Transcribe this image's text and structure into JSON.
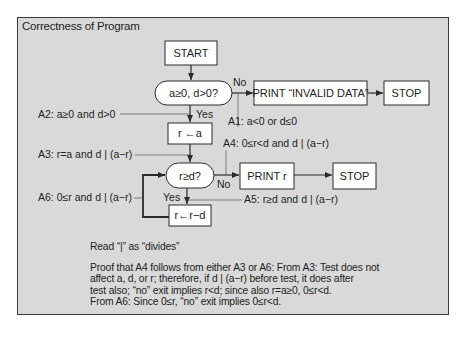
{
  "title": "Correctness of Program",
  "nodes": {
    "start": "START",
    "test1": "a≥0, d>0?",
    "print_invalid": "PRINT “INVALID DATA”",
    "stop1": "STOP",
    "assign_r": "r ←a",
    "test2": "r≥d?",
    "print_r": "PRINT r",
    "stop2": "STOP",
    "decrement": "r←r−d"
  },
  "edge_labels": {
    "test1_no": "No",
    "test1_yes": "Yes",
    "test2_no": "No",
    "test2_yes": "Yes"
  },
  "assertions": {
    "a1": "A1: a<0 or d≤0",
    "a2": "A2: a≥0 and d>0",
    "a3": "A3: r=a and d | (a−r)",
    "a4": "A4: 0≤r<d and d | (a−r)",
    "a5": "A5: r≥d and d | (a−r)",
    "a6": "A6: 0≤r and d | (a−r)"
  },
  "notes": {
    "read_as": "Read “|” as “divides”",
    "proof_lines": [
      "Proof that A4 follows from either A3 or A6: From A3: Test does not",
      "affect a, d, or r; therefore, if d | (a−r) before test, it does after",
      "test also; “no” exit implies r<d; since also r=a≥0, 0≤r<d.",
      "From A6: Since 0≤r, “no” exit implies 0≤r<d."
    ]
  },
  "colors": {
    "panel_bg": "#d9d9d9",
    "box_bg": "#ffffff",
    "line": "#2a2a2a"
  }
}
